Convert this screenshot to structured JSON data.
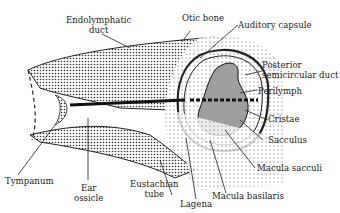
{
  "diagram": {
    "labels": {
      "endolymphatic_duct_1": "Endolymphatic",
      "endolymphatic_duct_2": "duct",
      "otic_bone": "Otic bone",
      "auditory_capsule": "Auditory capsule",
      "posterior_1": "Posterior",
      "posterior_2": "semicircular duct",
      "perilymph": "Perilymph",
      "cristae": "Cristae",
      "sacculus": "Sacculus",
      "macula_sacculi": "Macula sacculi",
      "macula_basilaris": "Macula basilaris",
      "lagena": "Lagena",
      "eustachian_1": "Eustachian",
      "eustachian_2": "tube",
      "ear_ossicle_1": "Ear",
      "ear_ossicle_2": "ossicle",
      "tympanum": "Tympanum"
    },
    "colors": {
      "ink": "#222222",
      "background": "#ffffff"
    }
  }
}
